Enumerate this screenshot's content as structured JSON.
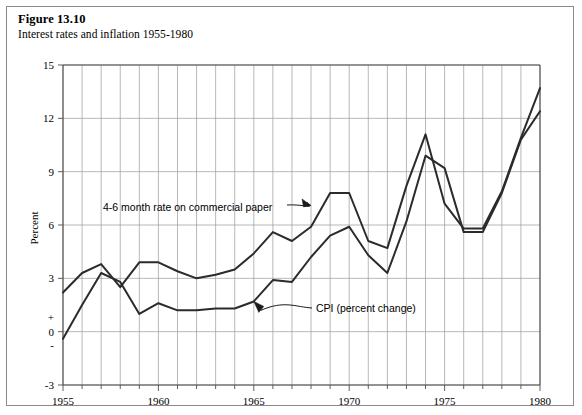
{
  "figure": {
    "number_label": "Figure 13.10",
    "caption": "Interest rates and inflation 1955-1980"
  },
  "chart_data": {
    "type": "line",
    "title": "Interest rates and inflation 1955-1980",
    "xlabel": "",
    "ylabel": "Percent",
    "xlim": [
      1955,
      1980
    ],
    "ylim": [
      -3,
      15
    ],
    "grid": true,
    "legend_position": "inline-annotations",
    "x": [
      1955,
      1956,
      1957,
      1958,
      1959,
      1960,
      1961,
      1962,
      1963,
      1964,
      1965,
      1966,
      1967,
      1968,
      1969,
      1970,
      1971,
      1972,
      1973,
      1974,
      1975,
      1976,
      1977,
      1978,
      1979,
      1980
    ],
    "y_ticks": [
      -3,
      0,
      3,
      6,
      9,
      12,
      15
    ],
    "y_tick_labels": [
      "-3",
      "0",
      "3",
      "6",
      "9",
      "12",
      "15"
    ],
    "zero_sign_labels": {
      "above": "+",
      "below": "-"
    },
    "x_tick_labels": [
      "1955",
      "1960",
      "1965",
      "1970",
      "1975",
      "1980"
    ],
    "x_ticks_major": [
      1955,
      1960,
      1965,
      1970,
      1975,
      1980
    ],
    "series": [
      {
        "name": "4-6 month rate on commercial paper",
        "values": [
          2.2,
          3.3,
          3.8,
          2.5,
          3.9,
          3.9,
          3.4,
          3.0,
          3.2,
          3.5,
          4.4,
          5.6,
          5.1,
          5.9,
          7.8,
          7.8,
          5.1,
          4.7,
          8.2,
          11.1,
          7.2,
          5.8,
          5.8,
          7.9,
          10.9,
          13.7
        ]
      },
      {
        "name": "CPI (percent change)",
        "values": [
          -0.4,
          1.5,
          3.3,
          2.8,
          1.0,
          1.6,
          1.2,
          1.2,
          1.3,
          1.3,
          1.7,
          2.9,
          2.8,
          4.2,
          5.4,
          5.9,
          4.3,
          3.3,
          6.2,
          9.9,
          9.2,
          5.6,
          5.6,
          7.8,
          10.8,
          12.4
        ]
      }
    ],
    "annotations": [
      {
        "text": "4-6 month rate on commercial paper",
        "points_to_year": 1968,
        "points_to_value": 7.1
      },
      {
        "text": "CPI (percent change)",
        "points_to_year": 1965,
        "points_to_value": 1.7
      }
    ]
  }
}
